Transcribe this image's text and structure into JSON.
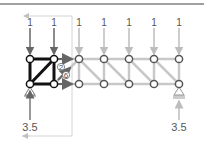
{
  "diagram": {
    "loads": [
      {
        "label": "1",
        "x": 30,
        "highlighted": true
      },
      {
        "label": "1",
        "x": 54,
        "highlighted": true
      },
      {
        "label": "1",
        "x": 79,
        "highlighted": false
      },
      {
        "label": "1",
        "x": 104,
        "highlighted": false
      },
      {
        "label": "1",
        "x": 129,
        "highlighted": false
      },
      {
        "label": "1",
        "x": 154,
        "highlighted": false
      },
      {
        "label": "1",
        "x": 179,
        "highlighted": false
      }
    ],
    "reactions": [
      {
        "label": "3.5",
        "side": "left"
      },
      {
        "label": "3.5",
        "side": "right"
      }
    ],
    "member_labels": [
      {
        "label": "2",
        "style": "circled"
      },
      {
        "label": "6",
        "style": "circled"
      }
    ],
    "colors": {
      "highlight_member": "#111111",
      "faded_member": "#c8c8c8",
      "force_arrow": "#666666",
      "faded_arrow": "#bdbdbd",
      "section_box": "#d4d4d4",
      "top_bar": "#a0a0a0"
    }
  }
}
